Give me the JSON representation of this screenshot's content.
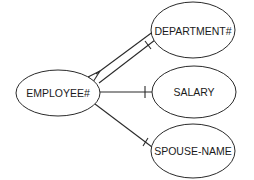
{
  "diagram": {
    "type": "entity-relationship / bubble chart",
    "nodes": [
      {
        "id": "employee",
        "label": "EMPLOYEE#",
        "cx": 58,
        "cy": 93,
        "rx": 42,
        "ry": 23
      },
      {
        "id": "department",
        "label": "DEPARTMENT#",
        "cx": 193,
        "cy": 30,
        "rx": 42,
        "ry": 28
      },
      {
        "id": "salary",
        "label": "SALARY",
        "cx": 194,
        "cy": 92,
        "rx": 42,
        "ry": 26
      },
      {
        "id": "spouse",
        "label": "SPOUSE-NAME",
        "cx": 193,
        "cy": 151,
        "rx": 42,
        "ry": 27
      }
    ],
    "edges": [
      {
        "from": "employee",
        "to": "department",
        "kind": "one-to-many",
        "note": "many end at EMPLOYEE# (crow's foot)"
      },
      {
        "from": "employee",
        "to": "department",
        "kind": "one",
        "note": "single bar at DEPARTMENT#"
      },
      {
        "from": "employee",
        "to": "salary",
        "kind": "one",
        "note": "single bar at SALARY"
      },
      {
        "from": "employee",
        "to": "spouse",
        "kind": "one",
        "note": "single bar at SPOUSE-NAME"
      }
    ],
    "colors": {
      "line": "#2a2a2a",
      "text": "#1a1a1a",
      "background": "#ffffff"
    }
  }
}
